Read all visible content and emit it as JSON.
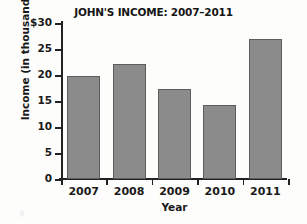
{
  "chart_data": {
    "type": "bar",
    "title": "JOHN'S INCOME: 2007–2011",
    "xlabel": "Year",
    "ylabel": "Income (in thousands)",
    "categories": [
      "2007",
      "2008",
      "2009",
      "2010",
      "2011"
    ],
    "values": [
      19.8,
      22.1,
      17.4,
      14.2,
      27.0
    ],
    "ytick_labels": [
      "$30",
      "25",
      "20",
      "15",
      "10",
      "5",
      "0"
    ],
    "ytick_values": [
      30,
      25,
      20,
      15,
      10,
      5,
      0
    ],
    "ylim": [
      0,
      30
    ],
    "grid": false,
    "legend": false,
    "bar_color": "#8b8b8b",
    "bar_edge_color": "#5d5d5d",
    "axis_color": "#222222",
    "background_color": "#fdfdfc"
  }
}
